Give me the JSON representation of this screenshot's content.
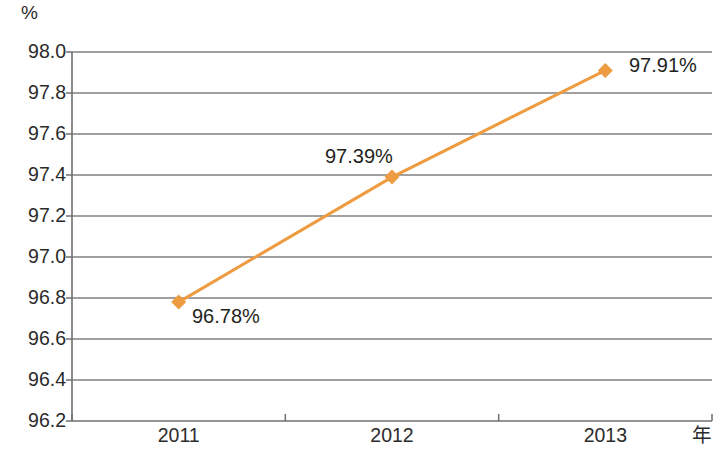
{
  "chart_data": {
    "type": "line",
    "title": "",
    "subtitle": "",
    "xlabel": "年",
    "ylabel": "%",
    "categories": [
      "2011",
      "2012",
      "2013"
    ],
    "series": [
      {
        "name": "",
        "values": [
          96.78,
          97.39,
          97.91
        ],
        "point_labels": [
          "96.78%",
          "97.39%",
          "97.91%"
        ],
        "color": "#ED9C42",
        "marker": "diamond"
      }
    ],
    "ylim": [
      96.2,
      98.0
    ],
    "yticks": [
      "96.2",
      "96.4",
      "96.6",
      "96.8",
      "97.0",
      "97.2",
      "97.4",
      "97.6",
      "97.8",
      "98.0"
    ],
    "ytick_values": [
      96.2,
      96.4,
      96.6,
      96.8,
      97.0,
      97.2,
      97.4,
      97.6,
      97.8,
      98.0
    ],
    "grid": "horizontal",
    "legend": "none",
    "axis_color": "#6f6f6f",
    "grid_color": "#808080",
    "text_color": "#231f20"
  },
  "axis": {
    "unit_label": "%",
    "x_unit_label": "年"
  }
}
